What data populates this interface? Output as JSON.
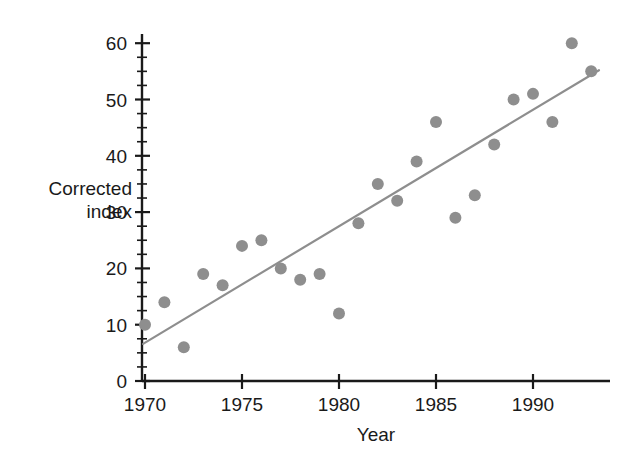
{
  "chart_data": {
    "type": "scatter",
    "title": "",
    "subtitle": "",
    "xlabel": "Year",
    "ylabel": "Corrected index",
    "ylabel_lines": [
      "Corrected",
      "index"
    ],
    "xlim": [
      1969.1,
      1994.0
    ],
    "ylim": [
      0,
      62
    ],
    "grid": false,
    "legend": null,
    "x": [
      1970,
      1971,
      1972,
      1973,
      1974,
      1975,
      1976,
      1977,
      1978,
      1979,
      1980,
      1981,
      1982,
      1983,
      1984,
      1985,
      1986,
      1987,
      1988,
      1989,
      1990,
      1991,
      1992,
      1993
    ],
    "values": [
      10,
      14,
      6,
      19,
      17,
      24,
      25,
      20,
      18,
      19,
      12,
      28,
      35,
      32,
      39,
      46,
      29,
      33,
      42,
      50,
      51,
      46,
      60,
      55
    ],
    "series": [
      {
        "name": "Corrected index",
        "marker": "circle",
        "color": "#8e8e8e",
        "points": [
          {
            "x": 1970,
            "y": 10
          },
          {
            "x": 1971,
            "y": 14
          },
          {
            "x": 1972,
            "y": 6
          },
          {
            "x": 1973,
            "y": 19
          },
          {
            "x": 1974,
            "y": 17
          },
          {
            "x": 1975,
            "y": 24
          },
          {
            "x": 1976,
            "y": 25
          },
          {
            "x": 1977,
            "y": 20
          },
          {
            "x": 1978,
            "y": 18
          },
          {
            "x": 1979,
            "y": 19
          },
          {
            "x": 1980,
            "y": 12
          },
          {
            "x": 1981,
            "y": 28
          },
          {
            "x": 1982,
            "y": 35
          },
          {
            "x": 1983,
            "y": 32
          },
          {
            "x": 1984,
            "y": 39
          },
          {
            "x": 1985,
            "y": 46
          },
          {
            "x": 1986,
            "y": 29
          },
          {
            "x": 1987,
            "y": 33
          },
          {
            "x": 1988,
            "y": 42
          },
          {
            "x": 1989,
            "y": 50
          },
          {
            "x": 1990,
            "y": 51
          },
          {
            "x": 1991,
            "y": 46
          },
          {
            "x": 1992,
            "y": 60
          },
          {
            "x": 1993,
            "y": 55
          }
        ]
      }
    ],
    "trend_line": {
      "name": "fitted-regression-line",
      "color": "#8e8e8e",
      "x0": 1969.9,
      "y0": 6.6,
      "x1": 1993.4,
      "y1": 55.2
    },
    "x_ticks": [
      1970,
      1975,
      1980,
      1985,
      1990
    ],
    "x_tick_labels": [
      "1970",
      "1975",
      "1980",
      "1985",
      "1990"
    ],
    "x_minor_ticks": [
      1971,
      1972,
      1973,
      1974,
      1976,
      1977,
      1978,
      1979,
      1981,
      1982,
      1983,
      1984,
      1986,
      1987,
      1988,
      1989,
      1991,
      1992,
      1993
    ],
    "y_ticks": [
      0,
      10,
      20,
      30,
      40,
      50,
      60
    ],
    "y_tick_labels": [
      "0",
      "10",
      "20",
      "30",
      "40",
      "50",
      "60"
    ],
    "y_minor_step": 2.5,
    "marker_radius": 6.0,
    "axis_color": "#1a1a1a",
    "background_color": "#ffffff"
  },
  "labels": {
    "y_axis_line1": "Corrected",
    "y_axis_line2": "index",
    "x_axis_title": "Year",
    "tick_0": "0",
    "tick_10": "10",
    "tick_20": "20",
    "tick_30": "30",
    "tick_40": "40",
    "tick_50": "50",
    "tick_60": "60",
    "tick_1970": "1970",
    "tick_1975": "1975",
    "tick_1980": "1980",
    "tick_1985": "1985",
    "tick_1990": "1990"
  }
}
